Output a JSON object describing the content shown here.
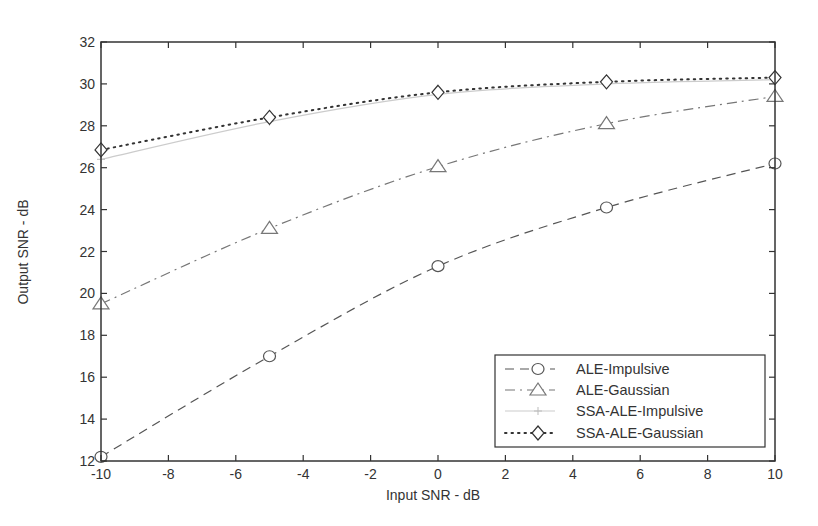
{
  "chart_data": {
    "type": "line",
    "title": "",
    "xlabel": "Input SNR - dB",
    "ylabel": "Output SNR - dB",
    "xlim": [
      -10,
      10
    ],
    "ylim": [
      12,
      32
    ],
    "xticks": [
      -10,
      -8,
      -6,
      -4,
      -2,
      0,
      2,
      4,
      6,
      8,
      10
    ],
    "yticks": [
      12,
      14,
      16,
      18,
      20,
      22,
      24,
      26,
      28,
      30,
      32
    ],
    "grid": false,
    "legend_position": "lower right",
    "x": [
      -10,
      -5,
      0,
      5,
      10
    ],
    "series": [
      {
        "name": "ALE-Impulsive",
        "marker": "circle",
        "linestyle": "dashed",
        "color": "#555555",
        "values": [
          12.2,
          17.0,
          21.3,
          24.1,
          26.2
        ]
      },
      {
        "name": "ALE-Gaussian",
        "marker": "triangle",
        "linestyle": "dashdot",
        "color": "#777777",
        "values": [
          19.5,
          23.1,
          26.05,
          28.1,
          29.4
        ]
      },
      {
        "name": "SSA-ALE-Impulsive",
        "marker": "plus",
        "linestyle": "solid",
        "color": "#cccccc",
        "values": [
          26.4,
          28.2,
          29.5,
          30.0,
          30.2
        ]
      },
      {
        "name": "SSA-ALE-Gaussian",
        "marker": "diamond",
        "linestyle": "dotted",
        "color": "#333333",
        "values": [
          26.85,
          28.4,
          29.6,
          30.1,
          30.3
        ]
      }
    ]
  }
}
